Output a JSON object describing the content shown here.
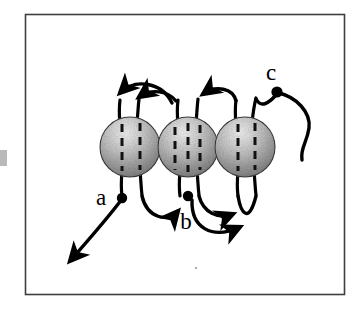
{
  "figure": {
    "frame": {
      "x": 25,
      "y": 14,
      "width": 320,
      "height": 281,
      "stroke_color": "#3a3a3a",
      "fill_color": "#ffffff",
      "stroke_width": 1.6
    },
    "background_color": "#ffffff",
    "ink_color": "#000000",
    "spheres": [
      {
        "id": "sphere-left",
        "cx": 130,
        "cy": 147,
        "r": 30,
        "dash_count": 2,
        "shading": "grainy-sphere-gradient"
      },
      {
        "id": "sphere-middle",
        "cx": 188,
        "cy": 147,
        "r": 30,
        "dash_count": 3,
        "shading": "grainy-sphere-gradient"
      },
      {
        "id": "sphere-right",
        "cx": 245,
        "cy": 147,
        "r": 30,
        "dash_count": 2,
        "shading": "grainy-sphere-gradient"
      }
    ],
    "labels": [
      {
        "id": "label-a",
        "text": "a",
        "x": 101,
        "y": 196,
        "size": 22
      },
      {
        "id": "label-b",
        "text": "b",
        "x": 186,
        "y": 229,
        "size": 22
      },
      {
        "id": "label-c",
        "text": "c",
        "x": 271,
        "y": 76,
        "size": 22
      }
    ],
    "points": [
      {
        "id": "point-a",
        "label": "a",
        "cx": 122,
        "cy": 198,
        "r": 5
      },
      {
        "id": "point-b",
        "label": "b",
        "cx": 188,
        "cy": 196,
        "r": 5
      },
      {
        "id": "point-c",
        "label": "c",
        "cx": 277,
        "cy": 92,
        "r": 5
      }
    ],
    "arrow_count": 8,
    "caption": ""
  }
}
